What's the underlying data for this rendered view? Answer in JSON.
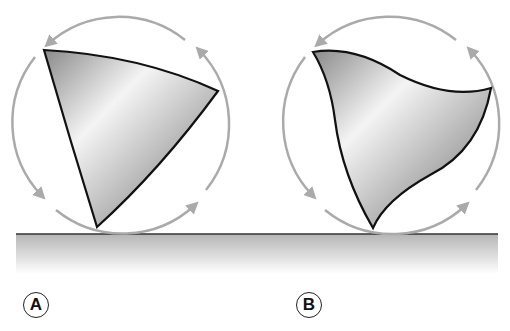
{
  "figure": {
    "panels": [
      {
        "id": "A",
        "label": "A",
        "shape": "reuleaux-like curved triangle (convex sides)",
        "rotation": "counter-clockwise arrows around circumscribed circle"
      },
      {
        "id": "B",
        "label": "B",
        "shape": "curved triangle with concave sides",
        "rotation": "counter-clockwise arrows around circumscribed circle"
      }
    ],
    "colors": {
      "outline": "#111111",
      "arrow": "#aaaaaa",
      "ground_line": "#333333",
      "ground_shadow": "#bdbdbd"
    }
  }
}
